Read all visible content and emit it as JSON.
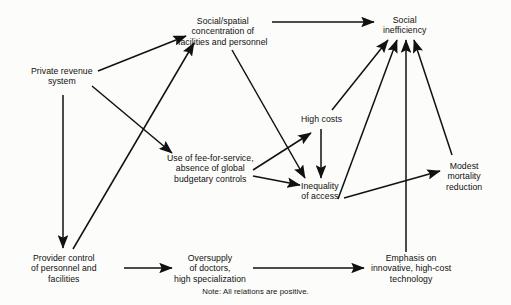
{
  "diagram": {
    "title_note": "Note: All relations are positive.",
    "stroke_color": "#111111",
    "background_color": "#fcfcfa",
    "nodes": [
      {
        "id": "private-revenue-system",
        "label": "Private revenue\nsystem",
        "cx": 62,
        "cy": 76
      },
      {
        "id": "social-spatial-concentration",
        "label": "Social/spatial\nconcentration of\nfacilities and personnel",
        "cx": 223,
        "cy": 31
      },
      {
        "id": "social-inefficiency",
        "label": "Social\ninefficiency",
        "cx": 404,
        "cy": 25
      },
      {
        "id": "high-costs",
        "label": "High costs",
        "cx": 321,
        "cy": 119
      },
      {
        "id": "fee-for-service",
        "label": "Use of fee-for-service,\nabsence of global\nbudgetary controls",
        "cx": 210,
        "cy": 168
      },
      {
        "id": "inequality-of-access",
        "label": "Inequality\nof access",
        "cx": 320,
        "cy": 191
      },
      {
        "id": "modest-mortality-reduction",
        "label": "Modest\nmortality\nreduction",
        "cx": 464,
        "cy": 176
      },
      {
        "id": "provider-control",
        "label": "Provider control\nof personnel and\nfacilities",
        "cx": 64,
        "cy": 268
      },
      {
        "id": "oversupply-of-doctors",
        "label": "Oversupply\nof doctors,\nhigh specialization",
        "cx": 210,
        "cy": 268
      },
      {
        "id": "emphasis-technology",
        "label": "Emphasis on\ninnovative, high-cost\ntechnology",
        "cx": 411,
        "cy": 268
      }
    ],
    "edges": [
      {
        "id": "private-revenue-to-concentration",
        "from": "private-revenue-system",
        "to": "social-spatial-concentration",
        "x1": 98,
        "y1": 71,
        "x2": 186,
        "y2": 36
      },
      {
        "id": "private-revenue-to-fee-for-service",
        "from": "private-revenue-system",
        "to": "fee-for-service",
        "x1": 92,
        "y1": 86,
        "x2": 172,
        "y2": 153
      },
      {
        "id": "private-revenue-to-provider-control",
        "from": "private-revenue-system",
        "to": "provider-control",
        "x1": 63,
        "y1": 95,
        "x2": 63,
        "y2": 248
      },
      {
        "id": "provider-control-to-concentration",
        "from": "provider-control",
        "to": "social-spatial-concentration",
        "x1": 73,
        "y1": 249,
        "x2": 194,
        "y2": 43
      },
      {
        "id": "concentration-to-inefficiency",
        "from": "social-spatial-concentration",
        "to": "social-inefficiency",
        "x1": 272,
        "y1": 22,
        "x2": 374,
        "y2": 22
      },
      {
        "id": "concentration-to-inequality",
        "from": "social-spatial-concentration",
        "to": "inequality-of-access",
        "x1": 232,
        "y1": 50,
        "x2": 305,
        "y2": 178
      },
      {
        "id": "fee-for-service-to-high-costs",
        "from": "fee-for-service",
        "to": "high-costs",
        "x1": 253,
        "y1": 170,
        "x2": 311,
        "y2": 133
      },
      {
        "id": "fee-for-service-to-inequality",
        "from": "fee-for-service",
        "to": "inequality-of-access",
        "x1": 253,
        "y1": 176,
        "x2": 300,
        "y2": 185
      },
      {
        "id": "high-costs-to-inefficiency",
        "from": "high-costs",
        "to": "social-inefficiency",
        "x1": 332,
        "y1": 110,
        "x2": 388,
        "y2": 40
      },
      {
        "id": "high-costs-to-inequality",
        "from": "high-costs",
        "to": "inequality-of-access",
        "x1": 321,
        "y1": 129,
        "x2": 321,
        "y2": 178
      },
      {
        "id": "inequality-to-inefficiency",
        "from": "inequality-of-access",
        "to": "social-inefficiency",
        "x1": 338,
        "y1": 199,
        "x2": 397,
        "y2": 40
      },
      {
        "id": "inequality-to-mortality",
        "from": "inequality-of-access",
        "to": "modest-mortality-reduction",
        "x1": 344,
        "y1": 198,
        "x2": 440,
        "y2": 171
      },
      {
        "id": "emphasis-to-inefficiency",
        "from": "emphasis-technology",
        "to": "social-inefficiency",
        "x1": 406,
        "y1": 252,
        "x2": 406,
        "y2": 40
      },
      {
        "id": "mortality-to-inefficiency",
        "from": "modest-mortality-reduction",
        "to": "social-inefficiency",
        "x1": 452,
        "y1": 155,
        "x2": 414,
        "y2": 40
      },
      {
        "id": "provider-control-to-oversupply",
        "from": "provider-control",
        "to": "oversupply-of-doctors",
        "x1": 124,
        "y1": 268,
        "x2": 172,
        "y2": 268
      },
      {
        "id": "oversupply-to-emphasis",
        "from": "oversupply-of-doctors",
        "to": "emphasis-technology",
        "x1": 253,
        "y1": 268,
        "x2": 364,
        "y2": 268
      }
    ]
  }
}
